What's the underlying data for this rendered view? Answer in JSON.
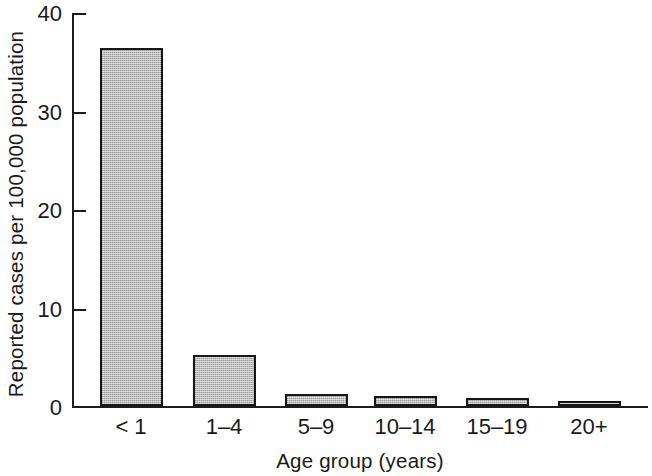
{
  "chart_data": {
    "type": "bar",
    "title": "",
    "subtitle": "",
    "xlabel": "Age group (years)",
    "ylabel": "Reported cases per 100,000 population",
    "categories": [
      "< 1",
      "1–4",
      "5–9",
      "10–14",
      "15–19",
      "20+"
    ],
    "values": [
      36.4,
      5.2,
      1.2,
      1.0,
      0.8,
      0.4
    ],
    "series": [
      {
        "name": "Reported cases per 100,000 population",
        "values": [
          36.4,
          5.2,
          1.2,
          1.0,
          0.8,
          0.4
        ]
      }
    ],
    "ylim": [
      0,
      40
    ],
    "yticks": [
      0,
      10,
      20,
      30,
      40
    ],
    "ytick_labels": [
      "0",
      "10",
      "20",
      "30",
      "40"
    ],
    "grid": false,
    "legend": false,
    "legend_position": "none",
    "bar_fill_color": "#b9b9b9",
    "bar_edge_color": "#161616",
    "axis_color": "#1c1c1c",
    "background_color": "#ffffff"
  },
  "axes": {
    "y": {
      "label": "Reported cases per 100,000 population",
      "ticks": [
        {
          "value": 40,
          "label": "40"
        },
        {
          "value": 30,
          "label": "30"
        },
        {
          "value": 20,
          "label": "20"
        },
        {
          "value": 10,
          "label": "10"
        },
        {
          "value": 0,
          "label": "0"
        }
      ]
    },
    "x": {
      "label": "Age group (years)",
      "ticks": [
        {
          "label": "< 1"
        },
        {
          "label": "1–4"
        },
        {
          "label": "5–9"
        },
        {
          "label": "10–14"
        },
        {
          "label": "15–19"
        },
        {
          "label": "20+"
        }
      ]
    }
  }
}
